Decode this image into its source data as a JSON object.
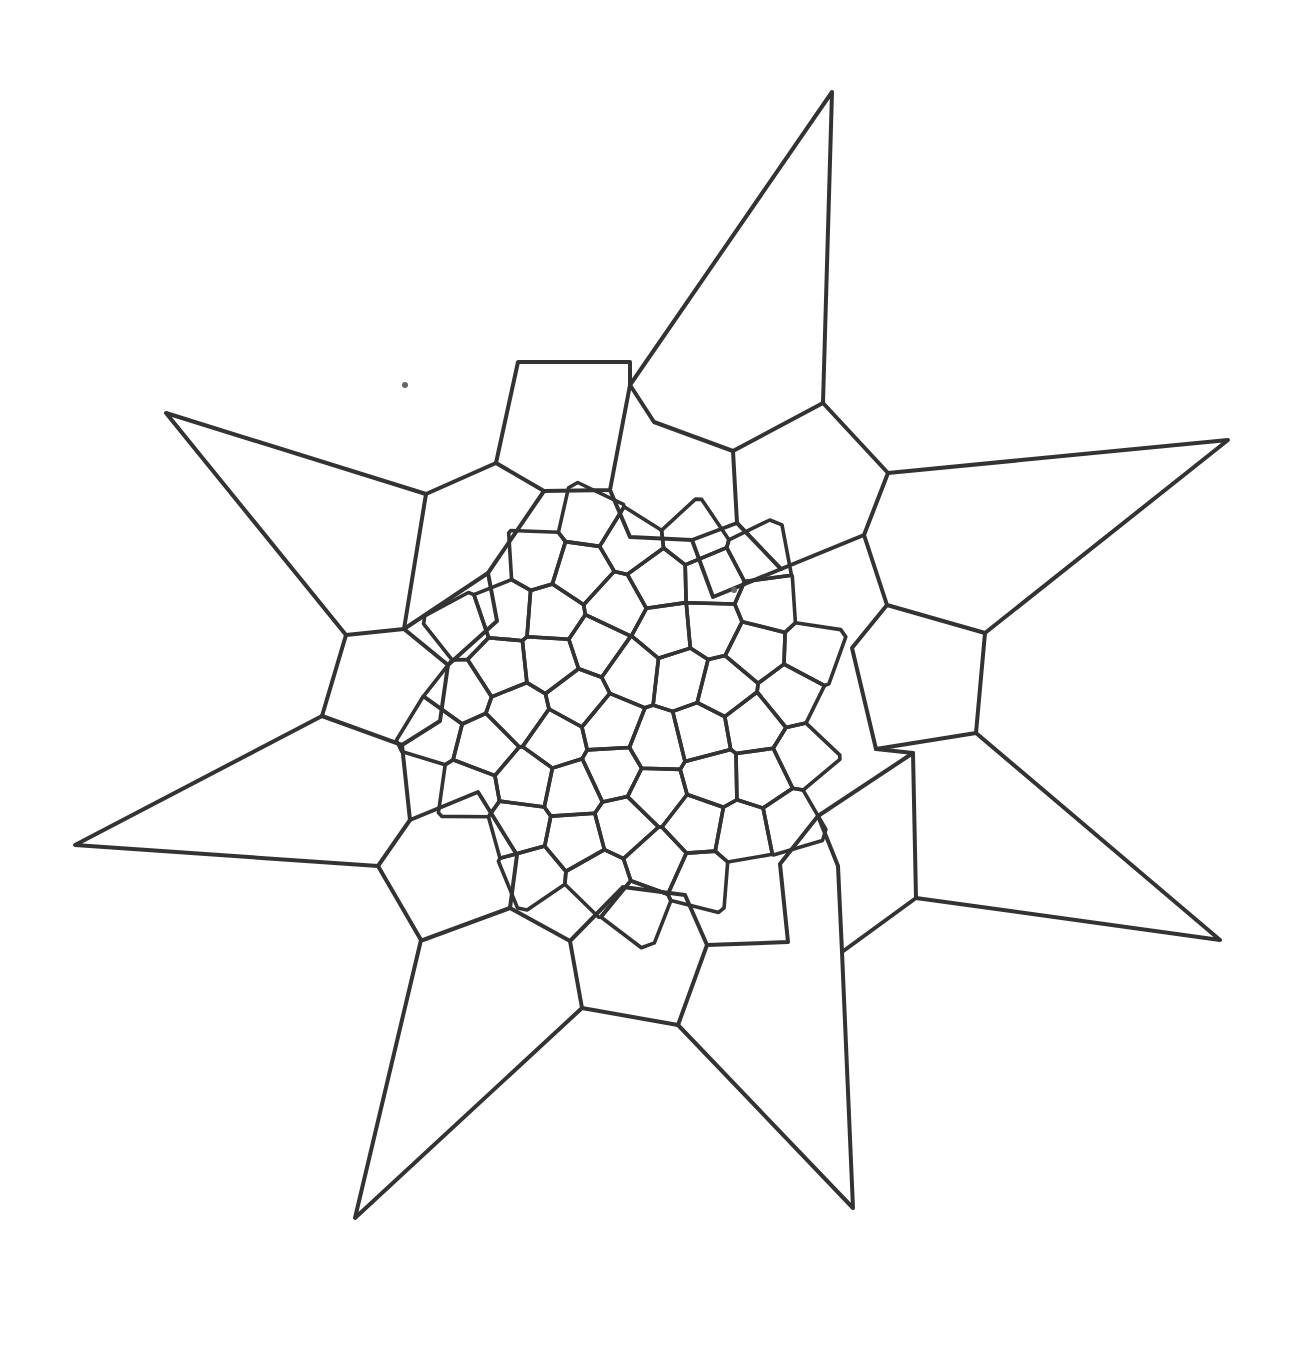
{
  "diagram": {
    "title": "",
    "colors": {
      "background": "#ffffff",
      "stroke": "#333333",
      "speck": "#666666"
    },
    "center": [
      630,
      708
    ],
    "star_points": 7,
    "outer_polylines": [
      [
        [
          630,
          385
        ],
        [
          832,
          92
        ],
        [
          823,
          403
        ]
      ],
      [
        [
          823,
          403
        ],
        [
          888,
          473
        ],
        [
          1228,
          440
        ],
        [
          985,
          633
        ]
      ],
      [
        [
          985,
          633
        ],
        [
          976,
          733
        ],
        [
          1220,
          940
        ],
        [
          916,
          898
        ]
      ],
      [
        [
          916,
          898
        ],
        [
          842,
          952
        ],
        [
          853,
          1208
        ],
        [
          678,
          1025
        ]
      ],
      [
        [
          678,
          1025
        ],
        [
          582,
          1008
        ],
        [
          355,
          1218
        ],
        [
          421,
          940
        ]
      ],
      [
        [
          421,
          940
        ],
        [
          378,
          866
        ],
        [
          75,
          845
        ],
        [
          322,
          716
        ]
      ],
      [
        [
          322,
          716
        ],
        [
          346,
          635
        ],
        [
          166,
          413
        ],
        [
          426,
          494
        ]
      ],
      [
        [
          426,
          494
        ],
        [
          496,
          463
        ],
        [
          518,
          362
        ],
        [
          630,
          362
        ],
        [
          630,
          385
        ]
      ]
    ],
    "ring_edges": [
      [
        [
          426,
          494
        ],
        [
          404,
          629
        ],
        [
          346,
          635
        ]
      ],
      [
        [
          496,
          463
        ],
        [
          544,
          491
        ],
        [
          610,
          490
        ],
        [
          630,
          385
        ]
      ],
      [
        [
          630,
          385
        ],
        [
          654,
          422
        ],
        [
          733,
          451
        ],
        [
          823,
          403
        ]
      ],
      [
        [
          733,
          451
        ],
        [
          737,
          523
        ],
        [
          781,
          569
        ]
      ],
      [
        [
          888,
          473
        ],
        [
          864,
          535
        ],
        [
          781,
          569
        ]
      ],
      [
        [
          864,
          535
        ],
        [
          887,
          605
        ],
        [
          985,
          633
        ]
      ],
      [
        [
          887,
          605
        ],
        [
          852,
          648
        ],
        [
          876,
          749
        ],
        [
          976,
          733
        ]
      ],
      [
        [
          876,
          749
        ],
        [
          913,
          753
        ],
        [
          916,
          898
        ]
      ],
      [
        [
          913,
          753
        ],
        [
          818,
          816
        ],
        [
          838,
          866
        ],
        [
          842,
          952
        ]
      ],
      [
        [
          818,
          816
        ],
        [
          780,
          864
        ],
        [
          788,
          942
        ],
        [
          707,
          945
        ],
        [
          678,
          1025
        ]
      ],
      [
        [
          707,
          945
        ],
        [
          685,
          895
        ],
        [
          623,
          887
        ],
        [
          570,
          941
        ],
        [
          582,
          1008
        ]
      ],
      [
        [
          570,
          941
        ],
        [
          510,
          908
        ],
        [
          423,
          940
        ]
      ],
      [
        [
          510,
          908
        ],
        [
          517,
          855
        ],
        [
          478,
          792
        ],
        [
          410,
          820
        ],
        [
          378,
          866
        ]
      ],
      [
        [
          410,
          820
        ],
        [
          402,
          745
        ],
        [
          322,
          716
        ]
      ],
      [
        [
          402,
          745
        ],
        [
          440,
          721
        ],
        [
          448,
          665
        ],
        [
          404,
          629
        ]
      ],
      [
        [
          448,
          665
        ],
        [
          497,
          621
        ],
        [
          488,
          573
        ],
        [
          404,
          629
        ]
      ],
      [
        [
          488,
          573
        ],
        [
          544,
          491
        ]
      ],
      [
        [
          610,
          490
        ],
        [
          630,
          537
        ],
        [
          692,
          540
        ],
        [
          737,
          523
        ]
      ],
      [
        [
          692,
          540
        ],
        [
          713,
          597
        ],
        [
          781,
          569
        ]
      ]
    ],
    "spiral_seeds": {
      "count": 230,
      "golden_angle_deg": 137.508,
      "scale": 26.5,
      "clip_radius": 330
    },
    "specks": [
      [
        734,
        590
      ],
      [
        405,
        385
      ]
    ]
  }
}
